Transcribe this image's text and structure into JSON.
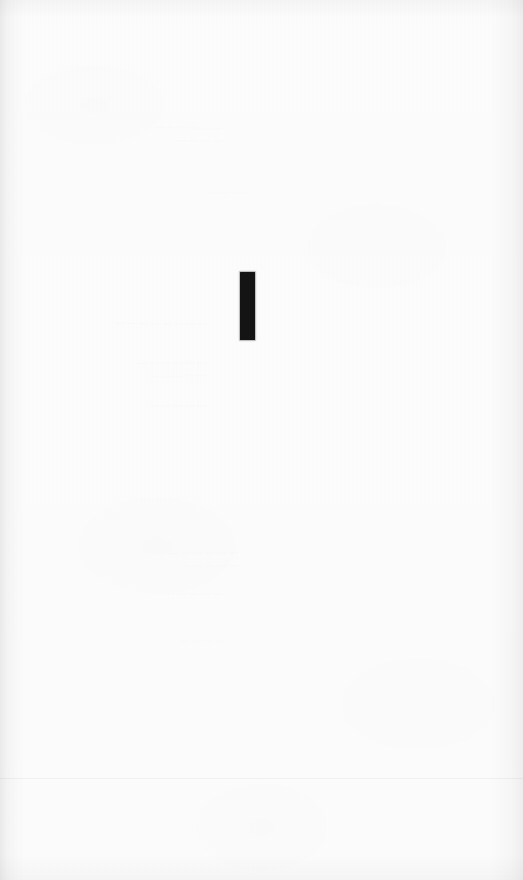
{
  "page": {
    "width": 523,
    "height": 880,
    "background_color": "#fcfcfc"
  },
  "main_mark": {
    "label": "I",
    "kind": "vertical-bar-glyph",
    "color": "#141414",
    "x": 240,
    "y": 272,
    "width": 15,
    "height": 68
  },
  "ghost_text": [
    {
      "id": "ghost-upper-left",
      "x": 72,
      "y": 120,
      "width": 150,
      "font_size": 9,
      "rotation": -0.6,
      "text": "— — — — — —\n—  — — —"
    },
    {
      "id": "ghost-upper-mid",
      "x": 130,
      "y": 186,
      "width": 120,
      "font_size": 8,
      "rotation": 0.4,
      "text": "— — — —"
    },
    {
      "id": "ghost-mid-left-a",
      "x": 42,
      "y": 316,
      "width": 165,
      "font_size": 9,
      "rotation": -0.5,
      "text": "— — — — —  — — —"
    },
    {
      "id": "ghost-mid-left-b",
      "x": 46,
      "y": 356,
      "width": 160,
      "font_size": 9,
      "rotation": 0.5,
      "text": "— — — — — —\n— — — — —"
    },
    {
      "id": "ghost-mid-left-c",
      "x": 76,
      "y": 398,
      "width": 130,
      "font_size": 9,
      "rotation": -0.3,
      "text": "— — — — —"
    },
    {
      "id": "ghost-lower-a",
      "x": 78,
      "y": 546,
      "width": 160,
      "font_size": 9,
      "rotation": 0.4,
      "text": "— — — — — —\n— — — — —"
    },
    {
      "id": "ghost-lower-b",
      "x": 72,
      "y": 586,
      "width": 150,
      "font_size": 9,
      "rotation": -0.4,
      "text": "— — — — —"
    },
    {
      "id": "ghost-lower-c",
      "x": 84,
      "y": 634,
      "width": 140,
      "font_size": 9,
      "rotation": 0.3,
      "text": "— — — —"
    }
  ],
  "scan_lines": [
    {
      "id": "scan-line-lower",
      "y": 778,
      "opacity": 0.045
    }
  ]
}
